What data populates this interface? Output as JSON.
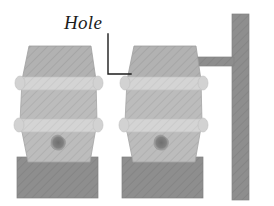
{
  "figure": {
    "type": "technical-illustration",
    "background_color": "#ffffff"
  },
  "annotations": [
    {
      "id": "hole",
      "label": "Hole",
      "style": "italic-serif",
      "color": "#1c1c1c",
      "leader": {
        "from_x": 108,
        "from_y": 34,
        "corner_x": 108,
        "corner_y": 74,
        "to_x": 131,
        "to_y": 74
      }
    }
  ],
  "colors": {
    "barrel_body": "#b9b9b9",
    "barrel_body_light": "#c8c8c8",
    "barrel_hoop": "#d6d6d6",
    "barrel_top": "#b0b0b0",
    "hole_dark": "#7a7a7a",
    "pedestal": "#8e8e8e",
    "pipe": "#8a8a8a",
    "post": "#8a8a8a",
    "outline": "#9a9a9a",
    "leader_line": "#1c1c1c"
  },
  "parts": [
    {
      "name": "barrel-left",
      "x": 16,
      "y": 46,
      "width": 85,
      "height": 112,
      "hoops": 2,
      "has_hole": true
    },
    {
      "name": "pedestal-left",
      "x": 17,
      "y": 157,
      "width": 81,
      "height": 41
    },
    {
      "name": "barrel-right",
      "x": 121,
      "y": 46,
      "width": 85,
      "height": 112,
      "hoops": 2,
      "has_hole": true
    },
    {
      "name": "pedestal-right",
      "x": 122,
      "y": 157,
      "width": 81,
      "height": 41
    },
    {
      "name": "pipe-horizontal",
      "x": 191,
      "y": 56,
      "width": 48,
      "height": 9
    },
    {
      "name": "post-vertical",
      "x": 232,
      "y": 14,
      "width": 17,
      "height": 186
    }
  ]
}
